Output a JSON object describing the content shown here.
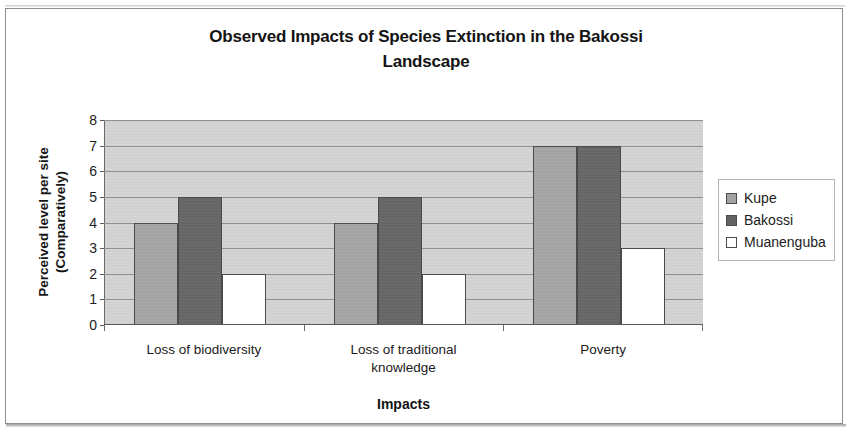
{
  "chart_data": {
    "type": "bar",
    "title": "Observed Impacts of Species Extinction in the Bakossi Landscape",
    "title_line1": "Observed Impacts of Species Extinction in the Bakossi",
    "title_line2": "Landscape",
    "xlabel": "Impacts",
    "ylabel": "Perceived level per site (Comparatively)",
    "ylabel_line1": "Perceived level per site",
    "ylabel_line2": "(Comparatively)",
    "categories": [
      "Loss of biodiversity",
      "Loss of traditional knowledge",
      "Poverty"
    ],
    "category_lines": [
      [
        "Loss of biodiversity"
      ],
      [
        "Loss of traditional",
        "knowledge"
      ],
      [
        "Poverty"
      ]
    ],
    "series": [
      {
        "name": "Kupe",
        "color": "#a3a3a3",
        "values": [
          4,
          4,
          7
        ]
      },
      {
        "name": "Bakossi",
        "color": "#636363",
        "values": [
          5,
          5,
          7
        ]
      },
      {
        "name": "Muanenguba",
        "color": "#ffffff",
        "values": [
          2,
          2,
          3
        ]
      }
    ],
    "ylim": [
      0,
      8
    ],
    "ytick_labels": [
      "0",
      "1",
      "2",
      "3",
      "4",
      "5",
      "6",
      "7",
      "8"
    ],
    "ytick_values": [
      0,
      1,
      2,
      3,
      4,
      5,
      6,
      7,
      8
    ],
    "grid": true,
    "legend_position": "right",
    "plot_background": "#d2d2d2",
    "bar_border_color": "#4a4a4a"
  },
  "legend": {
    "items": [
      {
        "label": "Kupe",
        "color": "#a3a3a3"
      },
      {
        "label": "Bakossi",
        "color": "#636363"
      },
      {
        "label": "Muanenguba",
        "color": "#ffffff"
      }
    ]
  }
}
